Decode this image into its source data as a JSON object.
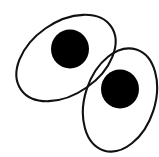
{
  "figure": {
    "width": 159,
    "height": 157,
    "background_color": "#ffffff",
    "stroke_color": "#111111",
    "fill_color": "#000000",
    "stroke_width": 2.1,
    "shapes": [
      {
        "name": "upper-left-ellipse-outline",
        "kind": "ellipse-outline",
        "cx": 66,
        "cy": 58,
        "rx": 55,
        "ry": 36,
        "rotation_deg": -35,
        "stroke": "#111111",
        "stroke_width": 2.1,
        "fill": "none"
      },
      {
        "name": "upper-left-disc",
        "kind": "filled-circle",
        "cx": 70,
        "cy": 49,
        "rx": 19,
        "ry": 19.5,
        "rotation_deg": 0,
        "stroke": "none",
        "stroke_width": 0,
        "fill": "#000000"
      },
      {
        "name": "lower-right-ellipse-outline",
        "kind": "ellipse-outline",
        "cx": 120,
        "cy": 100,
        "rx": 53,
        "ry": 35,
        "rotation_deg": -72,
        "stroke": "#111111",
        "stroke_width": 2.1,
        "fill": "none"
      },
      {
        "name": "lower-right-disc",
        "kind": "filled-circle",
        "cx": 120,
        "cy": 89,
        "rx": 19,
        "ry": 19.5,
        "rotation_deg": 0,
        "stroke": "none",
        "stroke_width": 0,
        "fill": "#000000"
      }
    ]
  }
}
